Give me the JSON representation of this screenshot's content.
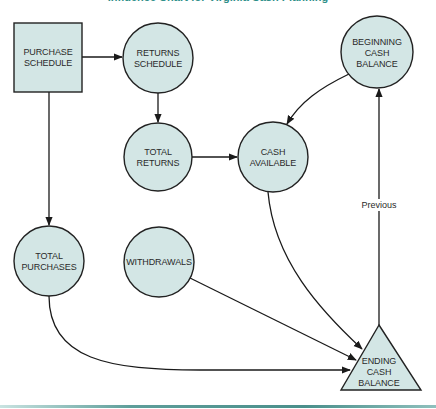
{
  "title": "Influence Chart for Virginia Cash Planning",
  "colors": {
    "node_fill": "#d3e6e5",
    "node_stroke": "#222222",
    "title_color": "#2f8f89",
    "bottom_bar": "#4a8f8b"
  },
  "nodes": {
    "purchase_schedule": {
      "label": "PURCHASE\nSCHEDULE",
      "shape": "square"
    },
    "returns_schedule": {
      "label": "RETURNS\nSCHEDULE",
      "shape": "circle"
    },
    "beginning_cash_balance": {
      "label": "BEGINNING\nCASH BALANCE",
      "shape": "circle"
    },
    "total_returns": {
      "label": "TOTAL\nRETURNS",
      "shape": "circle"
    },
    "cash_available": {
      "label": "CASH\nAVAILABLE",
      "shape": "circle"
    },
    "total_purchases": {
      "label": "TOTAL\nPURCHASES",
      "shape": "circle"
    },
    "withdrawals": {
      "label": "WITHDRAWALS",
      "shape": "circle"
    },
    "ending_cash_balance": {
      "label": "ENDING\nCASH BALANCE",
      "shape": "triangle"
    }
  },
  "edges": [
    {
      "from": "purchase_schedule",
      "to": "returns_schedule",
      "label": ""
    },
    {
      "from": "purchase_schedule",
      "to": "total_purchases",
      "label": ""
    },
    {
      "from": "returns_schedule",
      "to": "total_returns",
      "label": ""
    },
    {
      "from": "total_returns",
      "to": "cash_available",
      "label": ""
    },
    {
      "from": "beginning_cash_balance",
      "to": "cash_available",
      "label": ""
    },
    {
      "from": "cash_available",
      "to": "ending_cash_balance",
      "label": ""
    },
    {
      "from": "withdrawals",
      "to": "ending_cash_balance",
      "label": ""
    },
    {
      "from": "total_purchases",
      "to": "ending_cash_balance",
      "label": ""
    },
    {
      "from": "ending_cash_balance",
      "to": "beginning_cash_balance",
      "label": "Previous"
    }
  ],
  "edge_labels": {
    "previous": "Previous"
  }
}
